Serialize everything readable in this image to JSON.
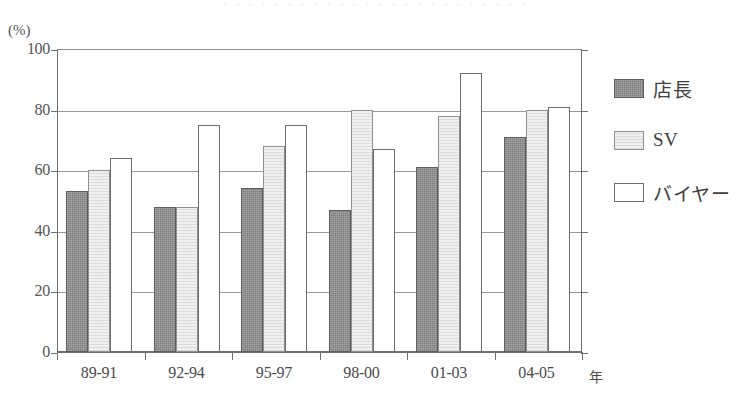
{
  "figure": {
    "faint_top_strip": "・・・・・・・・・・・・・・・・・・・・・・・・",
    "y_unit": "(%)",
    "x_unit": "年"
  },
  "legend": {
    "items": [
      {
        "label": "店長",
        "swatch": "s0",
        "color": "#7d7d7d"
      },
      {
        "label": "SV",
        "swatch": "s1",
        "color": "#f0f0f0"
      },
      {
        "label": "バイヤー",
        "swatch": "s2",
        "color": "#ffffff"
      }
    ]
  },
  "chart_data": {
    "type": "bar",
    "title": "",
    "xlabel": "年",
    "ylabel": "(%)",
    "ylim": [
      0,
      100
    ],
    "yticks": [
      0,
      20,
      40,
      60,
      80,
      100
    ],
    "grid": true,
    "legend_position": "right",
    "categories": [
      "89-91",
      "92-94",
      "95-97",
      "98-00",
      "01-03",
      "04-05"
    ],
    "series": [
      {
        "name": "店長",
        "values": [
          53,
          48,
          54,
          47,
          61,
          71
        ]
      },
      {
        "name": "SV",
        "values": [
          60,
          48,
          68,
          80,
          78,
          80
        ]
      },
      {
        "name": "バイヤー",
        "values": [
          64,
          75,
          75,
          67,
          92,
          81
        ]
      }
    ]
  }
}
